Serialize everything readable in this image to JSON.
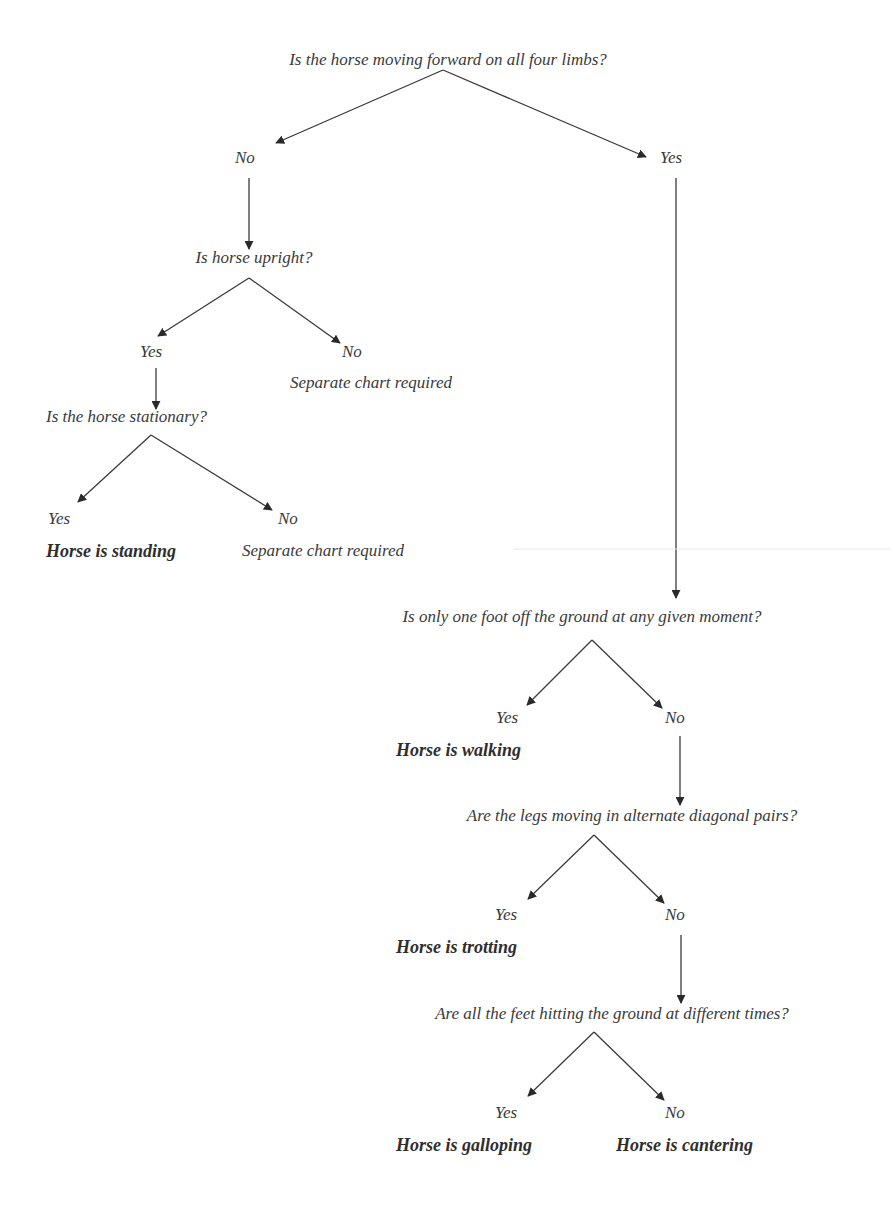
{
  "nodes": {
    "q1": "Is the horse moving forward on all four limbs?",
    "q1_no": "No",
    "q1_yes": "Yes",
    "q2": "Is horse upright?",
    "q2_yes": "Yes",
    "q2_no": "No",
    "q2_no_result": "Separate chart required",
    "q3": "Is the horse stationary?",
    "q3_yes": "Yes",
    "q3_yes_result": "Horse is standing",
    "q3_no": "No",
    "q3_no_result": "Separate chart required",
    "q4": "Is only one foot off the ground at any given moment?",
    "q4_yes": "Yes",
    "q4_yes_result": "Horse is walking",
    "q4_no": "No",
    "q5": "Are the legs moving in alternate diagonal pairs?",
    "q5_yes": "Yes",
    "q5_yes_result": "Horse is trotting",
    "q5_no": "No",
    "q6": "Are all the feet hitting the ground at different times?",
    "q6_yes": "Yes",
    "q6_yes_result": "Horse is galloping",
    "q6_no": "No",
    "q6_no_result": "Horse is cantering"
  },
  "colors": {
    "line": "#333333",
    "text": "#3a3a3a",
    "artifact_line": "#e6e6e6"
  }
}
